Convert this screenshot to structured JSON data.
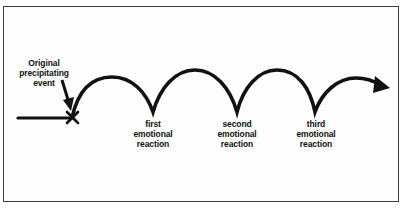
{
  "diagram": {
    "event_label": [
      "Original",
      "precipitating",
      "event"
    ],
    "reactions": [
      {
        "lines": [
          "first",
          "emotional",
          "reaction"
        ]
      },
      {
        "lines": [
          "second",
          "emotional",
          "reaction"
        ]
      },
      {
        "lines": [
          "third",
          "emotional",
          "reaction"
        ]
      }
    ],
    "colors": {
      "stroke": "#111111",
      "border": "#3a3a3a",
      "background": "#fdfdfd"
    }
  }
}
